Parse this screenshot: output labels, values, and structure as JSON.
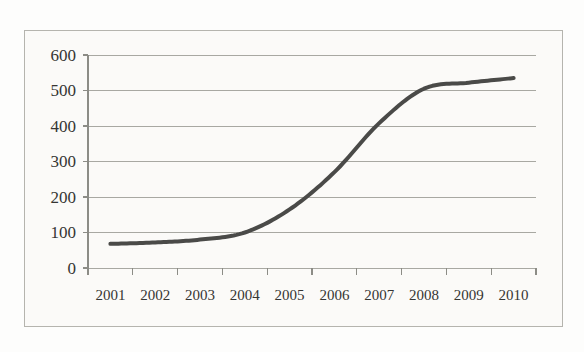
{
  "chart_data": {
    "type": "line",
    "title": "",
    "subtitle": "",
    "xlabel": "",
    "ylabel": "",
    "categories": [
      "2001",
      "2002",
      "2003",
      "2004",
      "2005",
      "2006",
      "2007",
      "2008",
      "2009",
      "2010"
    ],
    "series": [
      {
        "name": "series-1",
        "values": [
          68,
          72,
          80,
          100,
          165,
          270,
          408,
          505,
          522,
          535
        ]
      }
    ],
    "ylim": [
      0,
      600
    ],
    "yticks": [
      0,
      100,
      200,
      300,
      400,
      500,
      600
    ],
    "ytick_labels": [
      "0",
      "100",
      "200",
      "300",
      "400",
      "500",
      "600"
    ],
    "xtick_labels": [
      "2001",
      "2002",
      "2003",
      "2004",
      "2005",
      "2006",
      "2007",
      "2008",
      "2009",
      "2010"
    ],
    "grid": "horizontal",
    "legend": "none",
    "line_color": "#4a4a48",
    "line_width": 4,
    "grid_color": "#a8a8a2",
    "axis_color": "#8c8c86",
    "plot_background": "#fbfaf8",
    "frame_color": "#b5b4ae"
  },
  "axes": {
    "y_labels": [
      "600",
      "500",
      "400",
      "300",
      "200",
      "100",
      "0"
    ],
    "x_labels": [
      "2001",
      "2002",
      "2003",
      "2004",
      "2005",
      "2006",
      "2007",
      "2008",
      "2009",
      "2010"
    ]
  }
}
